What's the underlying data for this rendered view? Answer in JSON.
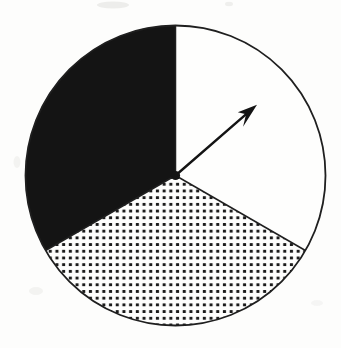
{
  "figure": {
    "ink_color": "#141414",
    "dot_color": "#1b1b1b",
    "line_color": "#1f1f1f",
    "paper_color": "#fdfdfc",
    "sector_white": "#fefefd"
  },
  "chart_data": {
    "type": "pie",
    "title": "",
    "xlabel": "",
    "ylabel": "",
    "legend": "none",
    "data_labels": "none",
    "categories": [
      "plain-sector",
      "dotted-sector",
      "black-sector"
    ],
    "values": [
      1,
      1,
      1
    ],
    "fractions": [
      0.3333,
      0.3333,
      0.3333
    ],
    "slices": [
      {
        "label": "plain-sector",
        "fraction": 0.3333,
        "pattern": "solid-white",
        "start_deg": 90,
        "end_deg": -30
      },
      {
        "label": "dotted-sector",
        "fraction": 0.3333,
        "pattern": "dot-grid",
        "start_deg": -30,
        "end_deg": -150
      },
      {
        "label": "black-sector",
        "fraction": 0.3333,
        "pattern": "solid-black",
        "start_deg": -150,
        "end_deg": -270
      }
    ],
    "arrow": {
      "points_into": "plain-sector",
      "angle_deg": 41,
      "length_ratio": 0.72
    }
  }
}
